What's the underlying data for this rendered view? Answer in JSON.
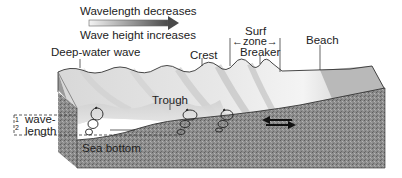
{
  "legend": {
    "line1": "Wavelength decreases",
    "line2": "Wave height increases"
  },
  "labels": {
    "deep_water_wave": "Deep-water wave",
    "crest": "Crest",
    "surf_zone_line1": "Surf",
    "surf_zone_line2": "zone",
    "breaker": "Breaker",
    "beach": "Beach",
    "trough": "Trough",
    "sea_bottom": "Sea bottom",
    "half": "1/2",
    "half_num": "1",
    "half_den": "2",
    "wave": "wave-",
    "length": "length"
  },
  "colors": {
    "arrow_start": "#f0f0f0",
    "arrow_end": "#555555",
    "water_light": "#f2f2f2",
    "water_mid": "#c8c8c8",
    "beach": "#b0b0b0",
    "sediment": "#8a8a8a",
    "ink": "#222222"
  }
}
